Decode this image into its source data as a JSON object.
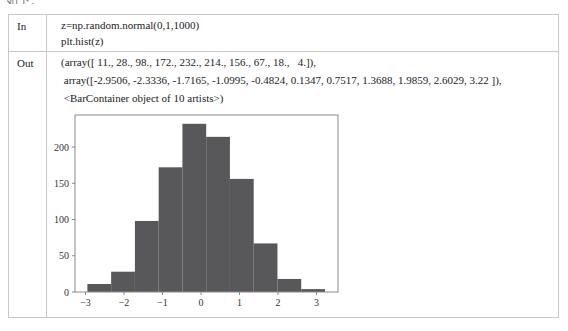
{
  "top_fragment": "如下：",
  "cell_in": {
    "label": "In",
    "lines": [
      "z=np.random.normal(0,1,1000)",
      "plt.hist(z)"
    ]
  },
  "cell_out": {
    "label": "Out",
    "lines": [
      "(array([ 11., 28., 98., 172., 232., 214., 156., 67., 18.,   4.]),",
      " array([-2.9506, -2.3336, -1.7165, -1.0995, -0.4824, 0.1347, 0.7517, 1.3688, 1.9859, 2.6029, 3.22 ]),",
      " <BarContainer object of 10 artists>)"
    ]
  },
  "colors": {
    "bar": "#58585a",
    "border": "#c8c8c8",
    "axis": "#8a8a8a"
  },
  "chart_data": {
    "type": "bar",
    "title": "",
    "xlabel": "",
    "ylabel": "",
    "bin_edges": [
      -2.9506,
      -2.3336,
      -1.7165,
      -1.0995,
      -0.4824,
      0.1347,
      0.7517,
      1.3688,
      1.9859,
      2.6029,
      3.22
    ],
    "values": [
      11,
      28,
      98,
      172,
      232,
      214,
      156,
      67,
      18,
      4
    ],
    "xticks": [
      -3,
      -2,
      -1,
      0,
      1,
      2,
      3
    ],
    "xtick_labels": [
      "−3",
      "−2",
      "−1",
      "0",
      "1",
      "2",
      "3"
    ],
    "yticks": [
      0,
      50,
      100,
      150,
      200
    ],
    "ytick_labels": [
      "0",
      "50",
      "100",
      "150",
      "200"
    ],
    "xlim": [
      -3.26,
      3.53
    ],
    "ylim": [
      0,
      244
    ],
    "grid": false,
    "legend": null
  }
}
